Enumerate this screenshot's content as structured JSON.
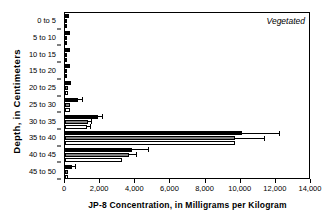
{
  "chart_data": {
    "type": "bar",
    "orientation": "horizontal",
    "title": "",
    "annotation": "Vegetated",
    "xlabel": "JP-8 Concentration, in Milligrams per Kilogram",
    "ylabel": "Depth, in Centimeters",
    "categories": [
      "0 to 5",
      "5 to 10",
      "10 to 15",
      "15 to 20",
      "20 to 25",
      "25 to 30",
      "30 to 35",
      "35 to 40",
      "40 to 45",
      "45 to 50"
    ],
    "xlim": [
      0,
      14000
    ],
    "xticks": [
      0,
      2000,
      4000,
      6000,
      8000,
      10000,
      12000,
      14000
    ],
    "xticklabels": [
      "0",
      "2,000",
      "4,000",
      "6,000",
      "8,000",
      "10,000",
      "12,000",
      "14,000"
    ],
    "grid": false,
    "legend": "none",
    "series": [
      {
        "name": "series-1",
        "color": "#000000",
        "values": [
          230,
          300,
          280,
          300,
          330,
          750,
          1900,
          10100,
          3800,
          400
        ],
        "errors": [
          0,
          0,
          0,
          0,
          0,
          200,
          200,
          2100,
          900,
          150
        ]
      },
      {
        "name": "series-2",
        "color": "#808080",
        "values": [
          0,
          0,
          0,
          120,
          180,
          290,
          1300,
          9700,
          3650,
          180
        ],
        "errors": [
          0,
          0,
          0,
          0,
          0,
          0,
          180,
          1600,
          400,
          0
        ]
      },
      {
        "name": "series-3",
        "color": "#ffffff",
        "values": [
          0,
          0,
          0,
          110,
          160,
          280,
          1250,
          9700,
          3250,
          160
        ],
        "errors": [
          0,
          0,
          0,
          0,
          0,
          0,
          170,
          0,
          0,
          0
        ]
      }
    ]
  }
}
